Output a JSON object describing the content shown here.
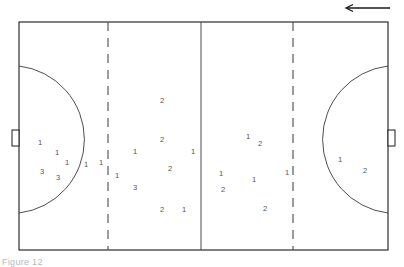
{
  "figure": {
    "caption": "Figure 12",
    "background_color": "#ffffff",
    "line_color": "#1a1a1a",
    "label_color": "#55555e"
  },
  "court": {
    "left": 19,
    "top": 22,
    "right": 388,
    "bottom": 250,
    "outline_name": "court-boundary"
  },
  "markings": {
    "center_line_x": 201,
    "left_dashed_line_x": 108,
    "right_dashed_line_x": 293,
    "left_arc_label": "left-goal-area-arc",
    "right_arc_label": "right-goal-area-arc",
    "left_goal_label": "left-goal",
    "right_goal_label": "right-goal"
  },
  "direction_arrow": {
    "label": "attack-direction-arrow",
    "direction": "left",
    "x_start": 390,
    "x_end": 345,
    "y": 8
  },
  "chart_data": {
    "type": "scatter",
    "xlabel": "",
    "ylabel": "",
    "xlim": [
      19,
      388
    ],
    "ylim": [
      22,
      250
    ],
    "grid": false,
    "legend": "none",
    "annotations": [
      "Arrow at top right indicates direction of play (leftward)",
      "Two dashed vertical lines mark the free-throw / substitution zones",
      "Solid vertical line marks the halfway line",
      "Semicircular arcs at each end mark the goal areas"
    ],
    "series": [
      {
        "name": "1",
        "description": "Players labelled 1",
        "points": [
          {
            "label": "1",
            "x": 40,
            "y": 143
          },
          {
            "label": "1",
            "x": 57,
            "y": 153
          },
          {
            "label": "1",
            "x": 67,
            "y": 163
          },
          {
            "label": "1",
            "x": 86,
            "y": 165
          },
          {
            "label": "1",
            "x": 101,
            "y": 163
          },
          {
            "label": "1",
            "x": 117,
            "y": 176
          },
          {
            "label": "1",
            "x": 135,
            "y": 152
          },
          {
            "label": "1",
            "x": 193,
            "y": 152
          },
          {
            "label": "1",
            "x": 184,
            "y": 210
          },
          {
            "label": "1",
            "x": 248,
            "y": 137
          },
          {
            "label": "1",
            "x": 221,
            "y": 174
          },
          {
            "label": "1",
            "x": 254,
            "y": 180
          },
          {
            "label": "1",
            "x": 287,
            "y": 173
          },
          {
            "label": "1",
            "x": 340,
            "y": 160
          }
        ]
      },
      {
        "name": "2",
        "description": "Players labelled 2",
        "points": [
          {
            "label": "2",
            "x": 162,
            "y": 101
          },
          {
            "label": "2",
            "x": 162,
            "y": 140
          },
          {
            "label": "2",
            "x": 170,
            "y": 169
          },
          {
            "label": "2",
            "x": 162,
            "y": 210
          },
          {
            "label": "2",
            "x": 260,
            "y": 144
          },
          {
            "label": "2",
            "x": 223,
            "y": 190
          },
          {
            "label": "2",
            "x": 265,
            "y": 209
          },
          {
            "label": "2",
            "x": 365,
            "y": 171
          }
        ]
      },
      {
        "name": "3",
        "description": "Players labelled 3",
        "points": [
          {
            "label": "3",
            "x": 42,
            "y": 172
          },
          {
            "label": "3",
            "x": 58,
            "y": 178
          },
          {
            "label": "3",
            "x": 135,
            "y": 188
          }
        ]
      }
    ]
  }
}
